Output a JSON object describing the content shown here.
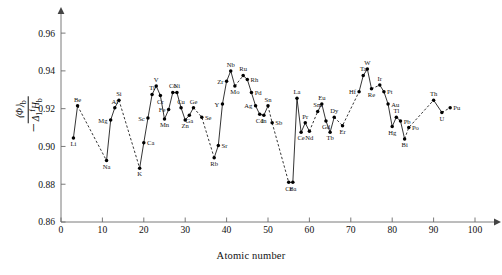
{
  "figure": {
    "y_axis_label_numerator": "⟨Φ⟩",
    "y_axis_label_numerator_sub": "b",
    "y_axis_label_denominator": "Δ",
    "y_axis_label_denominator_sub": "1",
    "y_axis_label_denominator_sup": "f",
    "y_axis_label_denominator_tail": "H",
    "y_axis_label_denominator_tail_sub": "b",
    "y_axis_label_sign": "−",
    "x_axis_title": "Atomic number"
  },
  "chart_data": {
    "type": "scatter",
    "title": "",
    "xlabel": "Atomic number",
    "ylabel": "-⟨Φ⟩b / Δ1fHb",
    "xlim": [
      0,
      104
    ],
    "ylim": [
      0.86,
      0.968
    ],
    "xticks": [
      0,
      10,
      20,
      30,
      40,
      50,
      60,
      70,
      80,
      90,
      100
    ],
    "xticklabels": [
      "0",
      "10",
      "20",
      "30",
      "40",
      "50",
      "60",
      "70",
      "80",
      "90",
      "100"
    ],
    "yticks": [
      0.86,
      0.88,
      0.9,
      0.92,
      0.94,
      0.96
    ],
    "yticklabels": [
      "0.86",
      "0.88",
      "0.90",
      "0.92",
      "0.94",
      "0.96"
    ],
    "grid": false,
    "legend": null,
    "marker": "filled-circle",
    "points": [
      {
        "label": "Li",
        "x": 3,
        "y": 0.9045,
        "lp": "below"
      },
      {
        "label": "Be",
        "x": 4,
        "y": 0.9215,
        "lp": "above"
      },
      {
        "label": "Na",
        "x": 11,
        "y": 0.8925,
        "lp": "below"
      },
      {
        "label": "Mg",
        "x": 12,
        "y": 0.914,
        "lp": "left"
      },
      {
        "label": "Al",
        "x": 13,
        "y": 0.9205,
        "lp": "above"
      },
      {
        "label": "Si",
        "x": 14,
        "y": 0.9245,
        "lp": "above"
      },
      {
        "label": "K",
        "x": 19,
        "y": 0.8885,
        "lp": "below"
      },
      {
        "label": "Ca",
        "x": 20,
        "y": 0.902,
        "lp": "right"
      },
      {
        "label": "Sc",
        "x": 21,
        "y": 0.915,
        "lp": "left"
      },
      {
        "label": "Ti",
        "x": 22,
        "y": 0.9275,
        "lp": "above"
      },
      {
        "label": "V",
        "x": 23,
        "y": 0.932,
        "lp": "above"
      },
      {
        "label": "Cr",
        "x": 24,
        "y": 0.927,
        "lp": "below"
      },
      {
        "label": "Mn",
        "x": 25,
        "y": 0.9145,
        "lp": "below"
      },
      {
        "label": "Fe",
        "x": 26,
        "y": 0.9195,
        "lp": "left"
      },
      {
        "label": "Co",
        "x": 27,
        "y": 0.9285,
        "lp": "above"
      },
      {
        "label": "Ni",
        "x": 28,
        "y": 0.9285,
        "lp": "above"
      },
      {
        "label": "Cu",
        "x": 29,
        "y": 0.9205,
        "lp": "above"
      },
      {
        "label": "Zn",
        "x": 30,
        "y": 0.914,
        "lp": "below"
      },
      {
        "label": "Ga",
        "x": 31,
        "y": 0.9165,
        "lp": "below"
      },
      {
        "label": "Ge",
        "x": 32,
        "y": 0.9205,
        "lp": "above"
      },
      {
        "label": "Se",
        "x": 34,
        "y": 0.9155,
        "lp": "right"
      },
      {
        "label": "Rb",
        "x": 37,
        "y": 0.894,
        "lp": "below"
      },
      {
        "label": "Sr",
        "x": 38,
        "y": 0.9005,
        "lp": "right"
      },
      {
        "label": "Y",
        "x": 39,
        "y": 0.9225,
        "lp": "left"
      },
      {
        "label": "Zr",
        "x": 40,
        "y": 0.9345,
        "lp": "left"
      },
      {
        "label": "Nb",
        "x": 41,
        "y": 0.94,
        "lp": "above"
      },
      {
        "label": "Mo",
        "x": 42,
        "y": 0.932,
        "lp": "below"
      },
      {
        "label": "Ru",
        "x": 44,
        "y": 0.9375,
        "lp": "above"
      },
      {
        "label": "Rh",
        "x": 45,
        "y": 0.9355,
        "lp": "right"
      },
      {
        "label": "Pd",
        "x": 46,
        "y": 0.9285,
        "lp": "right"
      },
      {
        "label": "Ag",
        "x": 47,
        "y": 0.9215,
        "lp": "left"
      },
      {
        "label": "Cd",
        "x": 48,
        "y": 0.917,
        "lp": "below"
      },
      {
        "label": "In",
        "x": 49,
        "y": 0.9165,
        "lp": "below"
      },
      {
        "label": "Sn",
        "x": 50,
        "y": 0.9215,
        "lp": "above"
      },
      {
        "label": "Sb",
        "x": 51,
        "y": 0.9125,
        "lp": "right"
      },
      {
        "label": "Cs",
        "x": 55,
        "y": 0.881,
        "lp": "below"
      },
      {
        "label": "Ba",
        "x": 56,
        "y": 0.881,
        "lp": "below"
      },
      {
        "label": "La",
        "x": 57,
        "y": 0.9255,
        "lp": "above"
      },
      {
        "label": "Ce",
        "x": 58,
        "y": 0.9075,
        "lp": "below"
      },
      {
        "label": "Pr",
        "x": 59,
        "y": 0.9125,
        "lp": "above"
      },
      {
        "label": "Nd",
        "x": 60,
        "y": 0.908,
        "lp": "below"
      },
      {
        "label": "Sm",
        "x": 62,
        "y": 0.9185,
        "lp": "above"
      },
      {
        "label": "Eu",
        "x": 63,
        "y": 0.9225,
        "lp": "above"
      },
      {
        "label": "Gd",
        "x": 64,
        "y": 0.9135,
        "lp": "below"
      },
      {
        "label": "Tb",
        "x": 65,
        "y": 0.9075,
        "lp": "below"
      },
      {
        "label": "Dy",
        "x": 66,
        "y": 0.9155,
        "lp": "above"
      },
      {
        "label": "Er",
        "x": 68,
        "y": 0.911,
        "lp": "below"
      },
      {
        "label": "Hf",
        "x": 72,
        "y": 0.929,
        "lp": "left"
      },
      {
        "label": "Ta",
        "x": 73,
        "y": 0.9375,
        "lp": "above"
      },
      {
        "label": "W",
        "x": 74,
        "y": 0.941,
        "lp": "above"
      },
      {
        "label": "Re",
        "x": 75,
        "y": 0.9305,
        "lp": "below"
      },
      {
        "label": "Ir",
        "x": 77,
        "y": 0.9325,
        "lp": "above"
      },
      {
        "label": "Pt",
        "x": 78,
        "y": 0.929,
        "lp": "right"
      },
      {
        "label": "Au",
        "x": 79,
        "y": 0.9225,
        "lp": "right"
      },
      {
        "label": "Hg",
        "x": 80,
        "y": 0.9105,
        "lp": "below"
      },
      {
        "label": "Tl",
        "x": 81,
        "y": 0.9155,
        "lp": "above"
      },
      {
        "label": "Pb",
        "x": 82,
        "y": 0.9135,
        "lp": "right"
      },
      {
        "label": "Bi",
        "x": 83,
        "y": 0.904,
        "lp": "below"
      },
      {
        "label": "Po",
        "x": 84,
        "y": 0.91,
        "lp": "right"
      },
      {
        "label": "Th",
        "x": 90,
        "y": 0.9245,
        "lp": "above"
      },
      {
        "label": "U",
        "x": 92,
        "y": 0.918,
        "lp": "below"
      },
      {
        "label": "Pu",
        "x": 94,
        "y": 0.9205,
        "lp": "right"
      }
    ],
    "segments": [
      {
        "style": "solid",
        "labels": [
          "Li",
          "Be"
        ]
      },
      {
        "style": "dashed",
        "labels": [
          "Be",
          "Na"
        ]
      },
      {
        "style": "solid",
        "labels": [
          "Na",
          "Mg",
          "Al",
          "Si"
        ]
      },
      {
        "style": "dashed",
        "labels": [
          "Si",
          "K"
        ]
      },
      {
        "style": "solid",
        "labels": [
          "K",
          "Ca",
          "Sc",
          "Ti",
          "V",
          "Cr",
          "Mn",
          "Fe",
          "Co",
          "Ni",
          "Cu",
          "Zn",
          "Ga",
          "Ge"
        ]
      },
      {
        "style": "dashed",
        "labels": [
          "Ge",
          "Se",
          "Rb"
        ]
      },
      {
        "style": "solid",
        "labels": [
          "Rb",
          "Sr",
          "Y",
          "Zr",
          "Nb",
          "Mo"
        ]
      },
      {
        "style": "dashed",
        "labels": [
          "Mo",
          "Ru"
        ]
      },
      {
        "style": "solid",
        "labels": [
          "Ru",
          "Rh",
          "Pd",
          "Ag",
          "Cd",
          "In",
          "Sn"
        ]
      },
      {
        "style": "dashed",
        "labels": [
          "Sn",
          "Sb",
          "Cs"
        ]
      },
      {
        "style": "solid",
        "labels": [
          "Cs",
          "Ba",
          "La",
          "Ce",
          "Pr",
          "Nd"
        ]
      },
      {
        "style": "dashed",
        "labels": [
          "Nd",
          "Sm"
        ]
      },
      {
        "style": "solid",
        "labels": [
          "Sm",
          "Eu",
          "Gd",
          "Tb",
          "Dy"
        ]
      },
      {
        "style": "dashed",
        "labels": [
          "Dy",
          "Er",
          "Hf"
        ]
      },
      {
        "style": "solid",
        "labels": [
          "Hf",
          "Ta",
          "W",
          "Re"
        ]
      },
      {
        "style": "dashed",
        "labels": [
          "Re",
          "Ir"
        ]
      },
      {
        "style": "solid",
        "labels": [
          "Ir",
          "Pt",
          "Au",
          "Hg",
          "Tl",
          "Pb",
          "Bi"
        ]
      },
      {
        "style": "dashed",
        "labels": [
          "Bi",
          "Po",
          "Th"
        ]
      },
      {
        "style": "solid",
        "labels": [
          "Th",
          "U"
        ]
      },
      {
        "style": "dashed",
        "labels": [
          "U",
          "Pu"
        ]
      }
    ]
  }
}
